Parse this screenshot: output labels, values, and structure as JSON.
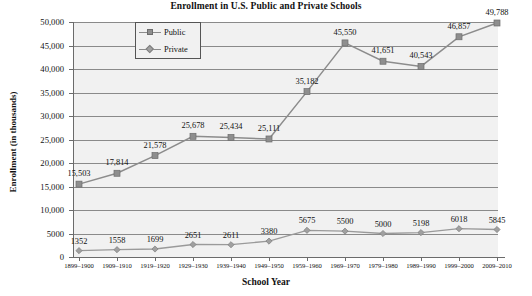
{
  "chart_data": {
    "type": "line",
    "title": "Enrollment in U.S. Public and Private Schools",
    "xlabel": "School Year",
    "ylabel": "Enrollment (in thousands)",
    "categories": [
      "1899–1900",
      "1909–1910",
      "1919–1920",
      "1929–1930",
      "1939–1940",
      "1949–1950",
      "1959–1960",
      "1969–1970",
      "1979–1980",
      "1989–1990",
      "1999–2000",
      "2009–2010"
    ],
    "series": [
      {
        "name": "Public",
        "values": [
          15503,
          17814,
          21578,
          25678,
          25434,
          25111,
          35182,
          45550,
          41651,
          40543,
          46857,
          49788
        ],
        "labels": [
          "15,503",
          "17,814",
          "21,578",
          "25,678",
          "25,434",
          "25,111",
          "35,182",
          "45,550",
          "41,651",
          "40,543",
          "46,857",
          "49,788"
        ],
        "marker": "square",
        "color": "#8e8e8e"
      },
      {
        "name": "Private",
        "values": [
          1352,
          1558,
          1699,
          2651,
          2611,
          3380,
          5675,
          5500,
          5000,
          5198,
          6018,
          5845
        ],
        "labels": [
          "1352",
          "1558",
          "1699",
          "2651",
          "2611",
          "3380",
          "5675",
          "5500",
          "5000",
          "5198",
          "6018",
          "5845"
        ],
        "marker": "diamond",
        "color": "#a0a0a0"
      }
    ],
    "ylim": [
      0,
      50000
    ],
    "yticks": [
      0,
      5000,
      10000,
      15000,
      20000,
      25000,
      30000,
      35000,
      40000,
      45000,
      50000
    ],
    "ytick_labels": [
      "0",
      "5000",
      "10,000",
      "15,000",
      "20,000",
      "25,000",
      "30,000",
      "35,000",
      "40,000",
      "45,000",
      "50,000"
    ],
    "grid": "horizontal",
    "legend_position": "top-left-inside",
    "plot_background": "#f1f1f1",
    "grid_color": "#8a8a8a",
    "axis_color": "#6b6b6b"
  }
}
